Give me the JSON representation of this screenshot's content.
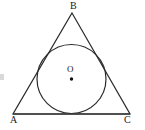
{
  "figure": {
    "background_color": "#ffffff",
    "stroke_color": "#2b2b2b",
    "label_color": "#1a1a1a",
    "canvas": {
      "width": 145,
      "height": 130
    }
  },
  "labels": {
    "apex": "B",
    "bottom_left": "A",
    "bottom_right": "C",
    "center": "O"
  },
  "shapes": {
    "triangle": {
      "name": "triangle-ABC",
      "vertices": [
        {
          "label": "B",
          "x": 72,
          "y": 13
        },
        {
          "label": "C",
          "x": 130,
          "y": 114
        },
        {
          "label": "A",
          "x": 13,
          "y": 114
        }
      ],
      "points_attr": "72,13 130,114 13,114",
      "stroke_width": 1.2
    },
    "incircle": {
      "name": "inscribed-circle",
      "cx": 71.5,
      "cy": 79,
      "r": 34.5,
      "stroke_width": 1.2
    },
    "center_dot": {
      "name": "center-point-O",
      "cx": 71.5,
      "cy": 79,
      "r": 1.7
    },
    "baseline": {
      "name": "base-segment-AC",
      "x1": 13,
      "y1": 114,
      "x2": 130,
      "y2": 114,
      "stroke_width": 1.6
    }
  }
}
